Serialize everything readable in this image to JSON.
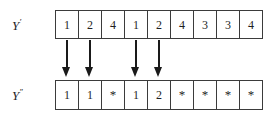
{
  "figure": {
    "caption": "",
    "rows": [
      {
        "id": "top",
        "label_base": "Y",
        "label_prime": "′",
        "label_full": "Y′",
        "cells": [
          "1",
          "2",
          "4",
          "1",
          "2",
          "4",
          "3",
          "3",
          "4"
        ]
      },
      {
        "id": "bottom",
        "label_base": "Y",
        "label_prime": "′′",
        "label_full": "Y′′",
        "cells": [
          "1",
          "1",
          "*",
          "1",
          "2",
          "*",
          "*",
          "*",
          "*"
        ]
      }
    ],
    "arrows": {
      "icon": "down-arrow-icon",
      "source_columns": [
        1,
        2,
        4,
        5
      ],
      "count": 4,
      "direction": "down"
    },
    "colors": {
      "background": "#ffffff",
      "border": "#3b3b3b",
      "text": "#1f1f1f",
      "arrow": "#1a1a1a"
    }
  }
}
